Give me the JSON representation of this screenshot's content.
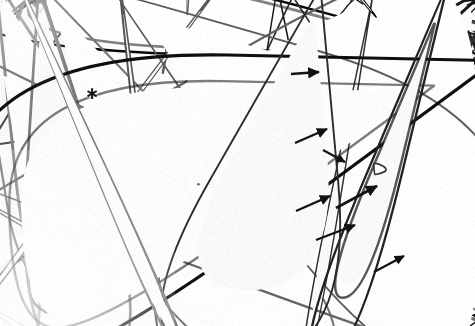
{
  "image": {
    "kind": "light-micrograph",
    "subject": "plant stem cross-section histological section",
    "width": 475,
    "height": 326,
    "background_color": "#ffffff",
    "wall_color": "#1a1a1a",
    "lumen_color": "#fbfbfb",
    "faded_region_color": "#f2f2f2"
  },
  "regions": [
    {
      "name": "pith-parenchyma",
      "label": "large thin-walled parenchyma cells",
      "x": 0,
      "y": 0,
      "w": 235,
      "h": 326,
      "cell_size_px": 34,
      "wall_thickness_px": 2.0,
      "darkness": 0.72
    },
    {
      "name": "transition-zone",
      "label": "graded transition from large to small cells",
      "x": 215,
      "y": 0,
      "w": 50,
      "h": 326,
      "cell_size_px": 17,
      "wall_thickness_px": 1.6,
      "darkness": 0.8
    },
    {
      "name": "vascular-bundle-zone",
      "label": "dense small cells with vascular elements",
      "x": 235,
      "y": 0,
      "w": 150,
      "h": 326,
      "cell_size_px": 11,
      "wall_thickness_px": 1.5,
      "darkness": 0.95
    },
    {
      "name": "xylem-vessel-zone",
      "label": "large thick-walled xylem vessels",
      "x": 385,
      "y": 0,
      "w": 90,
      "h": 280,
      "cell_size_px": 19,
      "wall_thickness_px": 2.6,
      "darkness": 1.0
    },
    {
      "name": "bleached-lower-left",
      "label": "faded pale region lower left",
      "x": 0,
      "y": 195,
      "w": 130,
      "h": 131,
      "cell_size_px": 38,
      "wall_thickness_px": 1.4,
      "darkness": 0.34
    },
    {
      "name": "bottom-margin-large-cells",
      "label": "enlarged cells along lower margin",
      "x": 215,
      "y": 270,
      "w": 260,
      "h": 56,
      "cell_size_px": 26,
      "wall_thickness_px": 2.0,
      "darkness": 0.8
    }
  ],
  "annotations": {
    "asterisks": [
      {
        "name": "asterisk-marker",
        "glyph": "∗",
        "x": 92,
        "y": 93
      }
    ],
    "arrows": [
      {
        "name": "arrow-marker-1",
        "x1": 291,
        "y1": 74,
        "x2": 319,
        "y2": 72,
        "width": 2.6
      },
      {
        "name": "arrow-marker-2",
        "x1": 295,
        "y1": 143,
        "x2": 327,
        "y2": 129,
        "width": 2.4
      },
      {
        "name": "arrow-marker-3",
        "x1": 296,
        "y1": 211,
        "x2": 330,
        "y2": 196,
        "width": 2.4
      },
      {
        "name": "arrow-marker-4",
        "x1": 336,
        "y1": 208,
        "x2": 377,
        "y2": 186,
        "width": 2.6
      },
      {
        "name": "arrow-marker-5",
        "x1": 316,
        "y1": 240,
        "x2": 355,
        "y2": 225,
        "width": 2.4
      },
      {
        "name": "arrow-marker-6",
        "x1": 374,
        "y1": 272,
        "x2": 404,
        "y2": 256,
        "width": 2.2
      },
      {
        "name": "arrow-marker-7",
        "x1": 323,
        "y1": 150,
        "x2": 345,
        "y2": 162,
        "width": 2.0
      }
    ]
  },
  "render": {
    "seed": 20240517,
    "cell_count_estimate": 1400,
    "vignette_strength": 0.05
  }
}
